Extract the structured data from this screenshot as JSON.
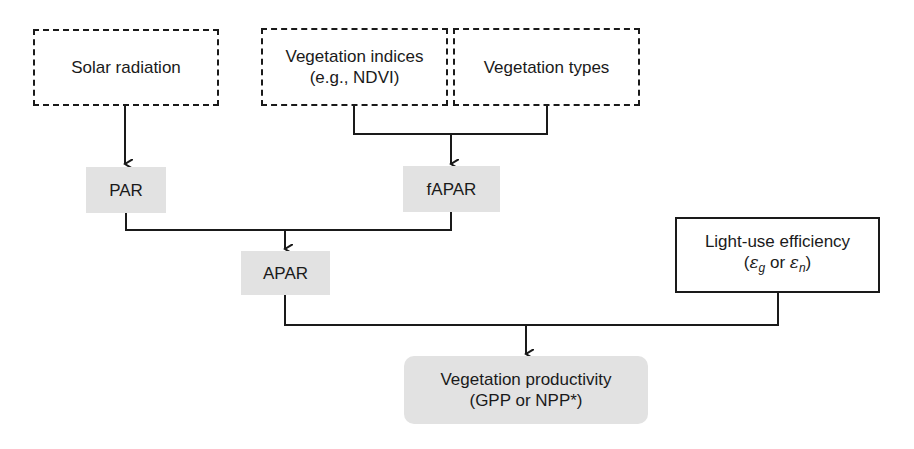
{
  "diagram": {
    "type": "flowchart",
    "nodes": {
      "solar_radiation": {
        "label": "Solar radiation",
        "style": "dashed"
      },
      "vegetation_indices": {
        "line1": "Vegetation indices",
        "line2": "(e.g., NDVI)",
        "style": "dashed"
      },
      "vegetation_types": {
        "label": "Vegetation types",
        "style": "dashed"
      },
      "par": {
        "label": "PAR",
        "style": "grey"
      },
      "fapar": {
        "label": "fAPAR",
        "style": "grey"
      },
      "apar": {
        "label": "APAR",
        "style": "grey"
      },
      "light_use_efficiency": {
        "line1": "Light-use efficiency",
        "open": "(",
        "eps1": "ε",
        "sub1": "g",
        "or": " or ",
        "eps2": "ε",
        "sub2": "n",
        "close": ")",
        "style": "solid"
      },
      "vegetation_productivity": {
        "line1": "Vegetation productivity",
        "line2": "(GPP or NPP*)",
        "style": "grey-rounded"
      }
    },
    "edges": [
      {
        "from": "solar_radiation",
        "to": "par"
      },
      {
        "from": [
          "vegetation_indices",
          "vegetation_types"
        ],
        "to": "fapar"
      },
      {
        "from": [
          "par",
          "fapar"
        ],
        "to": "apar"
      },
      {
        "from": [
          "apar",
          "light_use_efficiency"
        ],
        "to": "vegetation_productivity"
      }
    ],
    "colors": {
      "line": "#1a1a1a",
      "grey_fill": "#e2e2e2"
    }
  }
}
